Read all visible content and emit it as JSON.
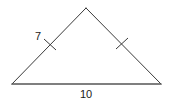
{
  "figure": {
    "type": "isosceles-triangle",
    "vertices": {
      "apex": [
        86,
        8
      ],
      "bottom_left": [
        12,
        84
      ],
      "bottom_right": [
        161,
        84
      ]
    },
    "labels": {
      "left_side": "7",
      "base": "10"
    },
    "congruence_marks": {
      "left_side": 1,
      "right_side": 1
    },
    "colors": {
      "stroke": "#3a3a3a",
      "text": "#1a1a1a",
      "background": "#ffffff"
    }
  }
}
